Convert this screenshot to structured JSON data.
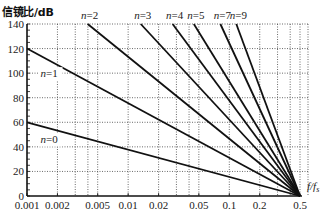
{
  "chart_data": {
    "type": "line",
    "title": "",
    "ylabel": "信镜比/dB",
    "xlabel": "f/fs",
    "xscale": "log",
    "xlim": [
      0.001,
      0.5
    ],
    "ylim": [
      0,
      140
    ],
    "grid": true,
    "x_ticks": [
      0.001,
      0.002,
      0.005,
      0.01,
      0.02,
      0.05,
      0.1,
      0.2,
      0.5
    ],
    "x_tick_labels": [
      "0.001",
      "0.002",
      "0.005",
      "0.01",
      "0.02",
      "0.05",
      "0.1",
      "0.2",
      "0.5"
    ],
    "x_minor_grid": [
      0.003,
      0.004,
      0.03,
      0.04,
      0.3,
      0.4
    ],
    "y_ticks": [
      0,
      20,
      40,
      60,
      80,
      100,
      120,
      140
    ],
    "y_tick_labels": [
      "0",
      "20",
      "40",
      "60",
      "80",
      "100",
      "120",
      "140"
    ],
    "series": [
      {
        "name": "n=0",
        "n": 0,
        "x": [
          0.001,
          0.5
        ],
        "y": [
          60,
          0
        ]
      },
      {
        "name": "n=1",
        "n": 1,
        "x": [
          0.001,
          0.5
        ],
        "y": [
          120,
          0
        ]
      },
      {
        "name": "n=2",
        "n": 2,
        "x": [
          0.001,
          0.5
        ],
        "y": [
          180,
          0
        ]
      },
      {
        "name": "n=3",
        "n": 3,
        "x": [
          0.001,
          0.5
        ],
        "y": [
          240,
          0
        ]
      },
      {
        "name": "n=4",
        "n": 4,
        "x": [
          0.001,
          0.5
        ],
        "y": [
          300,
          0
        ]
      },
      {
        "name": "n=5",
        "n": 5,
        "x": [
          0.001,
          0.5
        ],
        "y": [
          360,
          0
        ]
      },
      {
        "name": "n=7",
        "n": 7,
        "x": [
          0.001,
          0.5
        ],
        "y": [
          480,
          0
        ]
      },
      {
        "name": "n=9",
        "n": 9,
        "x": [
          0.001,
          0.5
        ],
        "y": [
          600,
          0
        ]
      }
    ],
    "annotations": [
      {
        "text": "n=0",
        "pos": "inside",
        "x": 0.0013,
        "y": 46
      },
      {
        "text": "n=1",
        "pos": "inside",
        "x": 0.0013,
        "y": 100
      },
      {
        "text": "n=2",
        "pos": "top"
      },
      {
        "text": "n=3",
        "pos": "top"
      },
      {
        "text": "n=4",
        "pos": "top"
      },
      {
        "text": "n=5",
        "pos": "top"
      },
      {
        "text": "n=7",
        "pos": "top"
      },
      {
        "text": "n=9",
        "pos": "top"
      }
    ]
  }
}
